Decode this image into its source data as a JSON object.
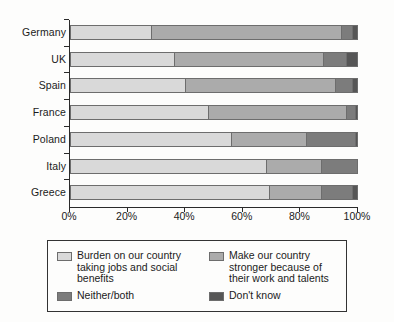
{
  "chart_data": {
    "type": "bar",
    "orientation": "horizontal",
    "stacked": true,
    "normalized_percent": true,
    "title": "",
    "xlabel": "",
    "ylabel": "",
    "xlim": [
      0,
      100
    ],
    "grid": false,
    "legend_position": "bottom",
    "categories": [
      "Germany",
      "UK",
      "Spain",
      "France",
      "Poland",
      "Italy",
      "Greece"
    ],
    "xtick_labels": [
      "0%",
      "20%",
      "40%",
      "60%",
      "80%",
      "100%"
    ],
    "xtick_values": [
      0,
      20,
      40,
      60,
      80,
      100
    ],
    "series": [
      {
        "name": "Burden on our country taking jobs and social benefits",
        "color": "#d9d9d9",
        "values": [
          28,
          36,
          40,
          48,
          56,
          68,
          69
        ]
      },
      {
        "name": "Make our country stronger because of their work and talents",
        "color": "#ababab",
        "values": [
          66,
          52,
          52,
          48,
          26,
          19,
          18
        ]
      },
      {
        "name": "Neither/both",
        "color": "#7c7c7c",
        "values": [
          4,
          8,
          6,
          3,
          17,
          13,
          11
        ]
      },
      {
        "name": "Don't know",
        "color": "#565656",
        "values": [
          2,
          4,
          2,
          1,
          1,
          0,
          2
        ]
      }
    ]
  },
  "legend": {
    "items": [
      {
        "label": "Burden on our country taking jobs and social benefits",
        "color": "#d9d9d9"
      },
      {
        "label": "Make our country stronger because of their work and talents",
        "color": "#ababab"
      },
      {
        "label": "Neither/both",
        "color": "#7c7c7c"
      },
      {
        "label": "Don't know",
        "color": "#565656"
      }
    ]
  }
}
